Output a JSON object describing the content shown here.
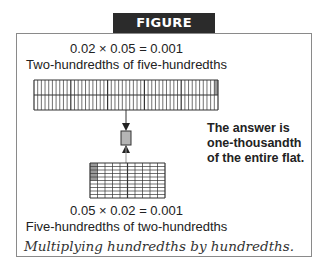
{
  "figure": {
    "title": "FIGURE 12.20",
    "top": {
      "equation": "0.02 × 0.05 = 0.001",
      "label": "Two-hundredths of five-hundredths",
      "strip": {
        "groups": 5,
        "columns_per_group": 10,
        "rows": 2,
        "shaded": "last column of top row"
      }
    },
    "center": {
      "element": "small shaded square representing the product",
      "arrows": [
        "down",
        "up"
      ]
    },
    "answer_note": {
      "lines": [
        "The answer is",
        "one-thousandth",
        "of the entire flat."
      ]
    },
    "bottom": {
      "equation": "0.05 × 0.02 = 0.001",
      "label": "Five-hundredths of two-hundredths",
      "grid": {
        "columns": 10,
        "rows": 10,
        "shaded": "top 5 cells of first column"
      }
    },
    "caption": "Multiplying hundredths by hundredths."
  },
  "colors": {
    "banner_bg": "#2b2b2b",
    "banner_text": "#ffffff",
    "frame_border": "#8a8a8a",
    "grid_line": "#333333",
    "shade": "#9a9a9a",
    "product_box": "#b5b5b5"
  }
}
